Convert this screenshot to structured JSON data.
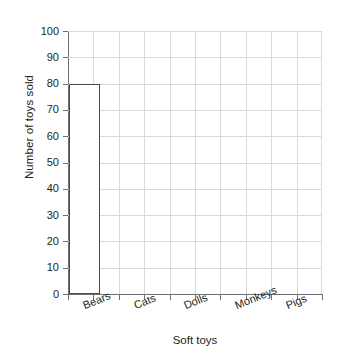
{
  "chart_data": {
    "type": "bar",
    "title": "",
    "xlabel": "Soft toys",
    "ylabel": "Number of toys sold",
    "categories": [
      "Bears",
      "Cats",
      "Dolls",
      "Monkeys",
      "Pigs"
    ],
    "values": [
      80,
      0,
      0,
      0,
      0
    ],
    "ylim": [
      0,
      100
    ],
    "ytick_labels": [
      "100",
      "90",
      "80",
      "70",
      "60",
      "50",
      "40",
      "30",
      "20",
      "10",
      "0"
    ],
    "ytick_values": [
      100,
      90,
      80,
      70,
      60,
      50,
      40,
      30,
      20,
      10,
      0
    ],
    "ytick_step": 10,
    "grid": "both",
    "x_columns": 10,
    "legend": "none",
    "bar_style": "outline",
    "bar_outline_color": "#4a4a4a",
    "bar_fill_color": "#ffffff",
    "gridline_color": "#d9d9d9",
    "axis_color": "#6d6e71",
    "text_color": "#231f20",
    "background_color": "#ffffff",
    "xlabel_rotation_deg": -22
  }
}
